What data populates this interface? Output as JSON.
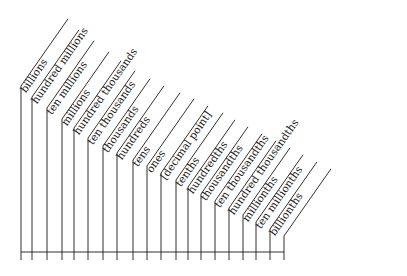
{
  "diagram": {
    "line_color": "#1a1a1a",
    "background": "#ffffff",
    "places": [
      {
        "label": "billions",
        "x": 21,
        "bend_y": 86
      },
      {
        "label": "hundred millions",
        "x": 32,
        "bend_y": 97
      },
      {
        "label": "ten millions",
        "x": 47,
        "bend_y": 108
      },
      {
        "label": "millions",
        "x": 62,
        "bend_y": 119
      },
      {
        "label": "hundred thousands",
        "x": 74,
        "bend_y": 128
      },
      {
        "label": "ten thousands",
        "x": 88,
        "bend_y": 138
      },
      {
        "label": "thousands",
        "x": 103,
        "bend_y": 146
      },
      {
        "label": "hundreds",
        "x": 117,
        "bend_y": 153
      },
      {
        "label": "tens",
        "x": 133,
        "bend_y": 160
      },
      {
        "label": "ones",
        "x": 147,
        "bend_y": 166
      },
      {
        "label": "[decimal point]",
        "x": 161,
        "bend_y": 173
      },
      {
        "label": "tenths",
        "x": 176,
        "bend_y": 180
      },
      {
        "label": "hundredths",
        "x": 188,
        "bend_y": 187
      },
      {
        "label": "thousandths",
        "x": 201,
        "bend_y": 194
      },
      {
        "label": "ten thousandths",
        "x": 215,
        "bend_y": 201
      },
      {
        "label": "hundred thousandths",
        "x": 229,
        "bend_y": 208
      },
      {
        "label": "millionths",
        "x": 243,
        "bend_y": 215
      },
      {
        "label": "ten millionths",
        "x": 256,
        "bend_y": 222
      },
      {
        "label": "billionths",
        "x": 270,
        "bend_y": 229
      }
    ],
    "baseline": {
      "y": 252,
      "x_start": 21,
      "x_end": 284,
      "tick_bottom": 260
    }
  }
}
